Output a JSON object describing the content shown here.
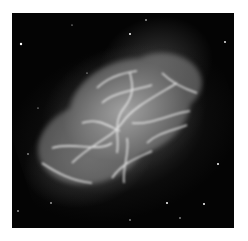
{
  "image": {
    "subject": "crab-nebula",
    "colors": {
      "background": "#ffffff",
      "sky": "#040404",
      "nebula_core": "#d7d7d7",
      "filament": "#f2f2f2"
    }
  }
}
